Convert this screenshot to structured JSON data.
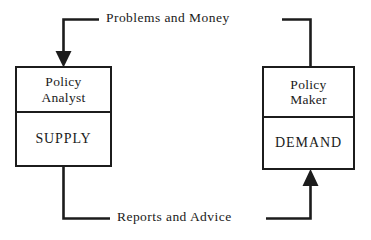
{
  "diagram": {
    "background_color": "#ffffff",
    "stroke_color": "#1c1c1c",
    "nodes": [
      {
        "id": "policy-analyst",
        "role": "Policy\nAnalyst",
        "function": "SUPPLY"
      },
      {
        "id": "policy-maker",
        "role": "Policy\nMaker",
        "function": "DEMAND"
      }
    ],
    "edges": [
      {
        "id": "problems-and-money",
        "label": "Problems and  Money",
        "from": "policy-maker",
        "to": "policy-analyst",
        "direction": "right-to-left",
        "arrowhead": "down-into-policy-analyst"
      },
      {
        "id": "reports-and-advice",
        "label": "Reports and Advice",
        "from": "policy-analyst",
        "to": "policy-maker",
        "direction": "left-to-right",
        "arrowhead": "up-into-policy-maker"
      }
    ]
  }
}
